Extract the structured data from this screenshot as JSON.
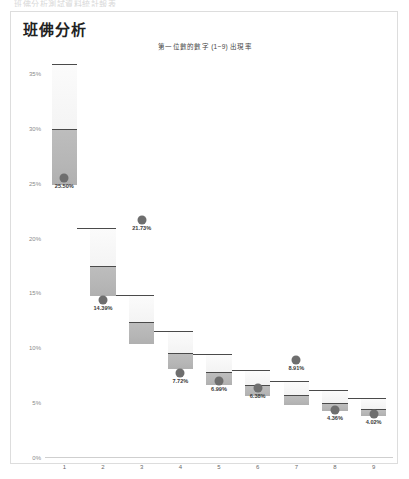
{
  "top_cut_text": "班佛分析測試資料統計報表",
  "panel": {
    "title": "班佛分析"
  },
  "chart_data": {
    "type": "bar",
    "title": "第一位數的數字 (1~9) 出現率",
    "xlabel": "",
    "ylabel": "",
    "ylim": [
      0,
      35
    ],
    "ytick_labels": [
      "0%",
      "5%",
      "10%",
      "15%",
      "20%",
      "25%",
      "30%",
      "35%"
    ],
    "ytick_values": [
      0,
      5,
      10,
      15,
      20,
      25,
      30,
      35
    ],
    "categories": [
      "1",
      "2",
      "3",
      "4",
      "5",
      "6",
      "7",
      "8",
      "9"
    ],
    "values": [
      25.5,
      14.39,
      21.73,
      7.72,
      6.99,
      6.38,
      8.91,
      4.36,
      4.02
    ],
    "value_labels": [
      "25.50%",
      "14.39%",
      "21.73%",
      "7.72%",
      "6.99%",
      "6.38%",
      "8.91%",
      "4.36%",
      "4.02%"
    ],
    "expected_ranges": [
      {
        "category": "1",
        "low": 25.0,
        "mid": 30.1,
        "high": 35.9
      },
      {
        "category": "2",
        "low": 14.9,
        "mid": 17.6,
        "high": 21.0
      },
      {
        "category": "3",
        "low": 10.5,
        "mid": 12.5,
        "high": 14.9
      },
      {
        "category": "4",
        "low": 8.2,
        "mid": 9.7,
        "high": 11.6
      },
      {
        "category": "5",
        "low": 6.7,
        "mid": 7.9,
        "high": 9.5
      },
      {
        "category": "6",
        "low": 5.7,
        "mid": 6.7,
        "high": 8.0
      },
      {
        "category": "7",
        "low": 4.9,
        "mid": 5.8,
        "high": 7.0
      },
      {
        "category": "8",
        "low": 4.4,
        "mid": 5.1,
        "high": 6.2
      },
      {
        "category": "9",
        "low": 3.9,
        "mid": 4.6,
        "high": 5.5
      }
    ],
    "grid": false,
    "legend": "none",
    "colors": {
      "dot": "#6e6e6e",
      "band_fill": "#b6b6b6",
      "box_fill": "#f4f4f4",
      "box_stroke": "#4a4a4a",
      "axis_text": "#8a8a8a",
      "panel_border": "#dddddd"
    }
  }
}
